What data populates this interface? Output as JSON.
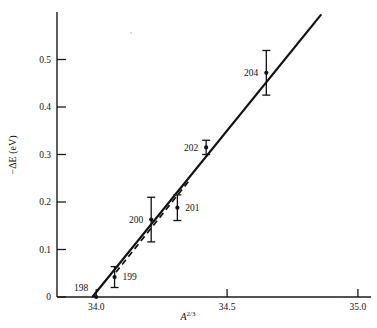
{
  "chart_data": {
    "type": "scatter",
    "title": "",
    "xlabel": "A^(2/3)",
    "ylabel": "-ΔE (eV)",
    "xlim": [
      33.85,
      35.05
    ],
    "ylim": [
      0,
      0.6
    ],
    "grid": false,
    "legend": "none",
    "xticks": [
      34.0,
      34.5,
      35.0
    ],
    "xticklabels": [
      "34.0",
      "34.5",
      "35.0"
    ],
    "yticks": [
      0,
      0.1,
      0.2,
      0.3,
      0.4,
      0.5
    ],
    "yticklabels": [
      "0",
      "0.1",
      "0.2",
      "0.3",
      "0.4",
      "0.5"
    ],
    "points": [
      {
        "label": "198",
        "x": 34.0,
        "y": 0.0,
        "yerr": 0.0,
        "label_side": "left"
      },
      {
        "label": "199",
        "x": 34.07,
        "y": 0.042,
        "yerr": 0.022,
        "label_side": "right"
      },
      {
        "label": "200",
        "x": 34.21,
        "y": 0.163,
        "yerr": 0.047,
        "label_side": "left"
      },
      {
        "label": "201",
        "x": 34.31,
        "y": 0.188,
        "yerr": 0.027,
        "label_side": "right"
      },
      {
        "label": "202",
        "x": 34.42,
        "y": 0.315,
        "yerr": 0.015,
        "label_side": "left"
      },
      {
        "label": "204",
        "x": 34.65,
        "y": 0.472,
        "yerr": 0.047,
        "label_side": "left"
      }
    ],
    "series": [
      {
        "name": "solid-fit-line",
        "style": "solid",
        "x": [
          33.985,
          34.86
        ],
        "y": [
          0.0,
          0.595
        ]
      },
      {
        "name": "dashed-fit-line",
        "style": "dashed",
        "x": [
          34.075,
          34.355
        ],
        "y": [
          0.052,
          0.245
        ]
      }
    ],
    "xlabel_parts": {
      "base": "A",
      "sup": "2/3"
    },
    "ylabel_text": "−ΔE (eV)"
  }
}
